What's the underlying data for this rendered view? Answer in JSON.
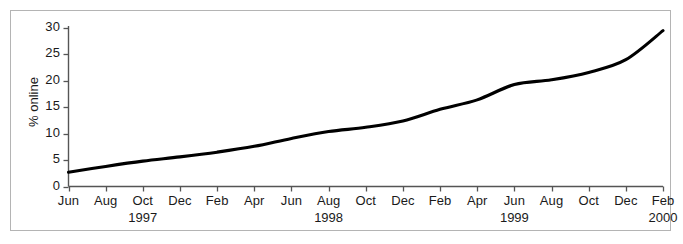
{
  "chart_data": {
    "type": "line",
    "title": "",
    "subtitle": "",
    "xlabel": "",
    "ylabel": "% online",
    "ylim": [
      0,
      30
    ],
    "yticks": [
      0,
      5,
      10,
      15,
      20,
      25,
      30
    ],
    "ytick_labels": [
      "0",
      "5",
      "10",
      "15",
      "20",
      "25",
      "30"
    ],
    "grid": false,
    "legend": null,
    "legend_position": "none",
    "line_color": "#000000",
    "x": [
      "Jun 1997",
      "Aug 1997",
      "Oct 1997",
      "Dec 1997",
      "Feb 1998",
      "Apr 1998",
      "Jun 1998",
      "Aug 1998",
      "Oct 1998",
      "Dec 1998",
      "Feb 1999",
      "Apr 1999",
      "Jun 1999",
      "Aug 1999",
      "Oct 1999",
      "Dec 1999",
      "Feb 2000"
    ],
    "xtick_labels": [
      "Jun",
      "Aug",
      "Oct",
      "Dec",
      "Feb",
      "Apr",
      "Jun",
      "Aug",
      "Oct",
      "Dec",
      "Feb",
      "Apr",
      "Jun",
      "Aug",
      "Oct",
      "Dec",
      "Feb"
    ],
    "year_labels": [
      {
        "label": "1997",
        "under_index": 2
      },
      {
        "label": "1998",
        "under_index": 7
      },
      {
        "label": "1999",
        "under_index": 12
      },
      {
        "label": "2000",
        "under_index": 16
      }
    ],
    "series": [
      {
        "name": "% online",
        "values": [
          2.7,
          3.8,
          4.8,
          5.6,
          6.5,
          7.4,
          8.6,
          10.3,
          11.1,
          12.0,
          13.6,
          15.4,
          17.2,
          19.4,
          20.3,
          21.2,
          22.3
        ]
      }
    ],
    "values": [
      2.7,
      3.8,
      4.8,
      5.6,
      6.5,
      7.4,
      8.6,
      10.3,
      11.1,
      12.0,
      13.6,
      15.4,
      17.2,
      19.4,
      20.3,
      21.2,
      22.3
    ],
    "curve_points": [
      {
        "x": "Jun 1997",
        "y": 2.7
      },
      {
        "x": "Aug 1997",
        "y": 3.8
      },
      {
        "x": "Oct 1997",
        "y": 4.8
      },
      {
        "x": "Dec 1997",
        "y": 5.6
      },
      {
        "x": "Feb 1998",
        "y": 6.5
      },
      {
        "x": "Apr 1998",
        "y": 7.6
      },
      {
        "x": "Jun 1998",
        "y": 9.1
      },
      {
        "x": "Aug 1998",
        "y": 10.4
      },
      {
        "x": "Oct 1998",
        "y": 11.2
      },
      {
        "x": "Dec 1998",
        "y": 12.4
      },
      {
        "x": "Feb 1999",
        "y": 14.6
      },
      {
        "x": "Apr 1999",
        "y": 16.4
      },
      {
        "x": "Jun 1999",
        "y": 19.3
      },
      {
        "x": "Aug 1999",
        "y": 20.2
      },
      {
        "x": "Oct 1999",
        "y": 21.6
      },
      {
        "x": "Dec 1999",
        "y": 24.0
      },
      {
        "x": "Feb 2000",
        "y": 29.5
      }
    ]
  }
}
